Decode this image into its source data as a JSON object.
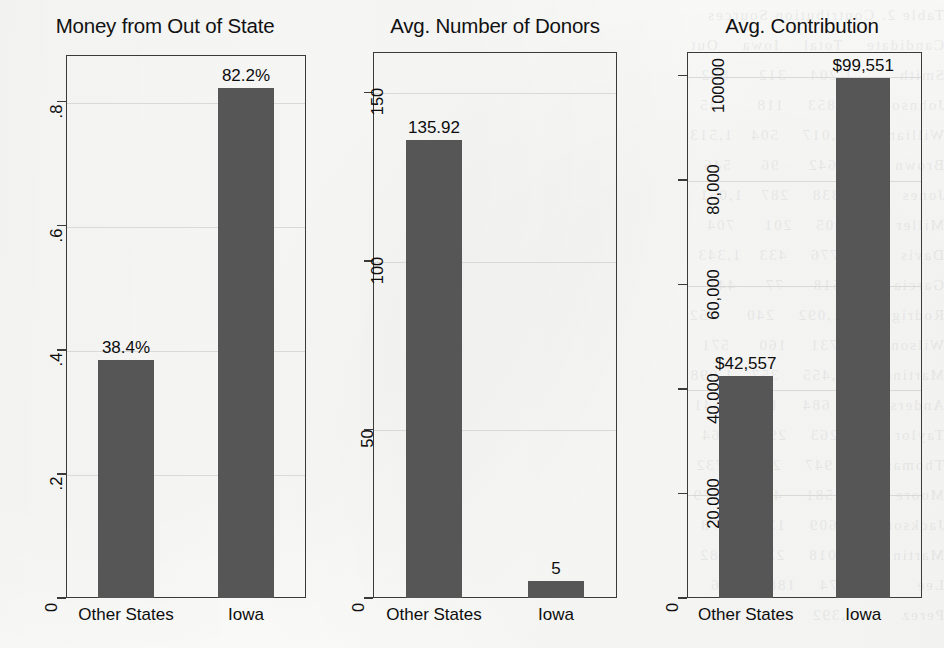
{
  "figure": {
    "background_color": "#fbfbfa",
    "bar_color": "#565656",
    "axis_color": "#3a3a3a",
    "grid_color": "#d9d9d9",
    "width": 944,
    "height": 648
  },
  "chart_data": [
    {
      "type": "bar",
      "title": "Money from Out of State",
      "xlabel": "",
      "ylabel": "",
      "categories": [
        "Other States",
        "Iowa"
      ],
      "values": [
        0.384,
        0.822
      ],
      "value_labels": [
        "38.4%",
        "82.2%"
      ],
      "ylim": [
        0,
        0.875
      ],
      "yticks": [
        0,
        0.2,
        0.4,
        0.6,
        0.8
      ],
      "ytick_labels": [
        "0",
        ".2",
        ".4",
        ".6",
        ".8"
      ],
      "grid": true,
      "legend": "none"
    },
    {
      "type": "bar",
      "title": "Avg. Number of Donors",
      "xlabel": "",
      "ylabel": "",
      "categories": [
        "Other States",
        "Iowa"
      ],
      "values": [
        135.92,
        5
      ],
      "value_labels": [
        "135.92",
        "5"
      ],
      "ylim": [
        0,
        162
      ],
      "yticks": [
        0,
        50,
        100,
        150
      ],
      "ytick_labels": [
        "0",
        "50",
        "100",
        "150"
      ],
      "grid": true,
      "legend": "none"
    },
    {
      "type": "bar",
      "title": "Avg. Contribution",
      "xlabel": "",
      "ylabel": "",
      "categories": [
        "Other States",
        "Iowa"
      ],
      "values": [
        42557,
        99551
      ],
      "value_labels": [
        "$42,557",
        "$99,551"
      ],
      "ylim": [
        0,
        104500
      ],
      "yticks": [
        0,
        20000,
        40000,
        60000,
        80000,
        100000
      ],
      "ytick_labels": [
        "0",
        "20,000",
        "40,000",
        "60,000",
        "80,000",
        "100000"
      ],
      "grid": true,
      "legend": "none"
    }
  ],
  "panel_geometry": [
    {
      "left": 0,
      "width": 330,
      "plot_left": 66,
      "plot_top": 55,
      "plot_right": 306,
      "plot_bottom": 598
    },
    {
      "left": 330,
      "width": 330,
      "plot_left": 43,
      "plot_top": 52,
      "plot_right": 287,
      "plot_bottom": 598
    },
    {
      "left": 660,
      "width": 284,
      "plot_left": 27,
      "plot_top": 52,
      "plot_right": 262,
      "plot_bottom": 598
    }
  ],
  "showthrough_text": "Table 2. Contribution Sources\nCandidate    Total    Iowa    Out\nSmith        1,204    312     892\nJohnson        853    118     735\nWilliams     2,017    504   1,513\nBrown          642     96     546\nJones        1,338    287   1,051\nMiller         905    201     704\nDavis        1,776    433   1,343\nGarcia         518     77     441\nRodriguez    1,092    240     852\nWilson         731    160     571\nMartinez     1,455    357   1,098\nAnderson       684    143     541\nTaylor       1,263    299     964\nThomas         947    215     732\nMoore        1,581    402   1,179\nJackson        609    131     478\nMartin       1,018    236     782\nLee            874    188     686\nPerez        1,392    341   1,051"
}
